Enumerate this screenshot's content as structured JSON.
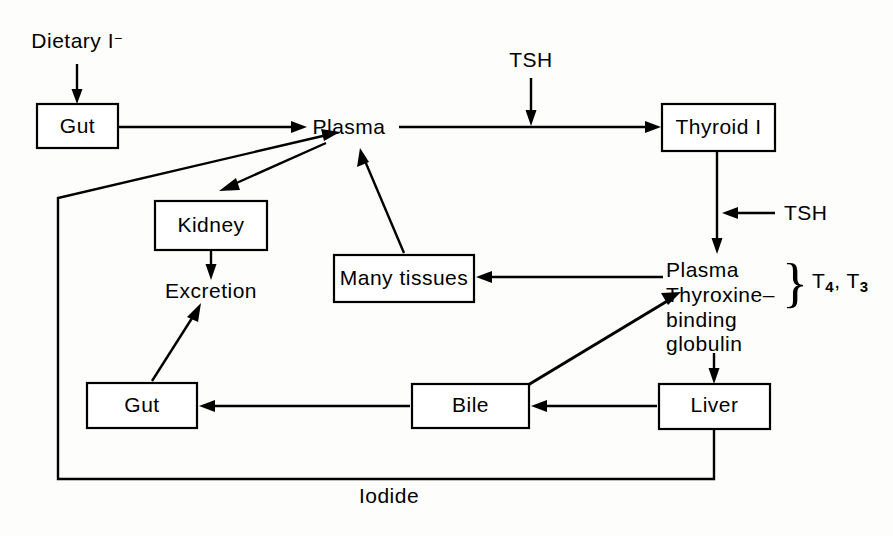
{
  "diagram": {
    "background_color": "#fdfdfc",
    "line_color": "#000000",
    "nodes": {
      "gut_top": {
        "label": "Gut"
      },
      "plasma_top": {
        "label": "Plasma"
      },
      "thyroid": {
        "label": "Thyroid I"
      },
      "kidney": {
        "label": "Kidney"
      },
      "excretion": {
        "label": "Excretion"
      },
      "many_tissues": {
        "label": "Many tissues"
      },
      "gut_bottom": {
        "label": "Gut"
      },
      "bile": {
        "label": "Bile"
      },
      "liver": {
        "label": "Liver"
      },
      "tbg": {
        "line1": "Plasma",
        "line2": "Thyroxine–",
        "line3": "binding",
        "line4": "globulin"
      }
    },
    "labels": {
      "dietary_iodide": {
        "text": "Dietary I",
        "superscript": "−"
      },
      "tsh_plasma_to_thyroid": {
        "text": "TSH"
      },
      "tsh_thyroid_output": {
        "text": "TSH"
      },
      "hormones": {
        "t4_base": "T",
        "t4_sub": "4",
        "separator": ", ",
        "t3_base": "T",
        "t3_sub": "3"
      },
      "brace": "}",
      "iodide_feedback": {
        "text": "Iodide"
      }
    },
    "edges": [
      {
        "from": "dietary_iodide",
        "to": "gut_top",
        "kind": "arrow"
      },
      {
        "from": "gut_top",
        "to": "plasma_top",
        "kind": "arrow"
      },
      {
        "from": "tsh_plasma_to_thyroid",
        "to": "plasma_thyroid_line",
        "kind": "arrow"
      },
      {
        "from": "plasma_top",
        "to": "thyroid",
        "kind": "arrow"
      },
      {
        "from": "thyroid",
        "to": "tbg",
        "kind": "arrow"
      },
      {
        "from": "tsh_thyroid_output",
        "to": "thyroid_tbg_line",
        "kind": "arrow"
      },
      {
        "from": "plasma_top",
        "to": "kidney",
        "kind": "arrow"
      },
      {
        "from": "kidney",
        "to": "excretion",
        "kind": "arrow"
      },
      {
        "from": "many_tissues",
        "to": "plasma_top",
        "kind": "arrow"
      },
      {
        "from": "tbg",
        "to": "many_tissues",
        "kind": "arrow"
      },
      {
        "from": "tbg",
        "to": "liver",
        "kind": "arrow"
      },
      {
        "from": "liver",
        "to": "bile",
        "kind": "arrow"
      },
      {
        "from": "bile",
        "to": "gut_bottom",
        "kind": "arrow"
      },
      {
        "from": "bile",
        "to": "tbg",
        "kind": "arrow"
      },
      {
        "from": "gut_bottom",
        "to": "excretion",
        "kind": "arrow"
      },
      {
        "from": "liver",
        "to": "plasma_top",
        "kind": "arrow",
        "label": "Iodide"
      }
    ]
  }
}
